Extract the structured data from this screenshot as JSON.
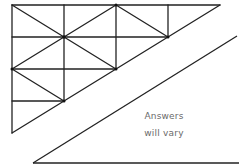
{
  "diagram": {
    "grid_triangle": {
      "columns_x": [
        12,
        64,
        116,
        168,
        220
      ],
      "rows_y": [
        5,
        37,
        69,
        101,
        133
      ],
      "diagonals": [
        [
          12,
          5,
          64,
          37
        ],
        [
          64,
          37,
          116,
          5
        ],
        [
          116,
          5,
          168,
          37
        ],
        [
          64,
          37,
          12,
          69
        ],
        [
          64,
          37,
          116,
          69
        ],
        [
          12,
          69,
          64,
          101
        ]
      ]
    },
    "answer_triangle": {
      "points": [
        [
          33,
          163
        ],
        [
          237,
          36
        ],
        [
          237,
          163
        ]
      ],
      "text_line1": "Answers",
      "text_line2": "will vary"
    },
    "stroke_color": "#222222",
    "text_color": "#6a6a6a"
  }
}
